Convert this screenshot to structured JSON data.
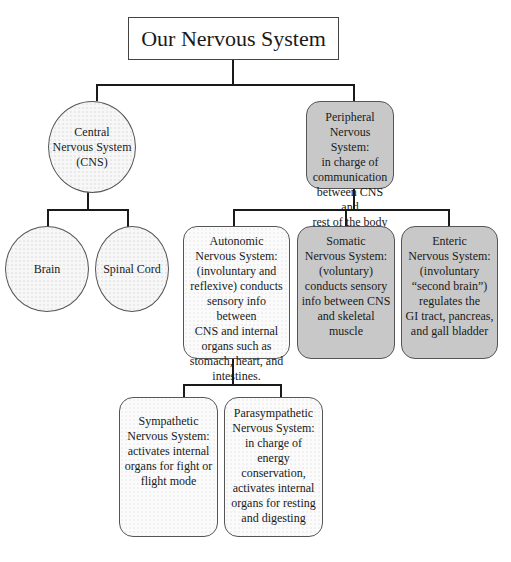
{
  "diagram": {
    "title": "Our Nervous System",
    "nodes": {
      "cns": {
        "label": "Central\nNervous System\n(CNS)",
        "shape": "circle"
      },
      "brain": {
        "label": "Brain",
        "shape": "circle"
      },
      "spinal_cord": {
        "label": "Spinal Cord",
        "shape": "circle"
      },
      "peripheral": {
        "label": "Peripheral\nNervous System:\nin charge of\ncommunication\nbetween CNS and\nrest of the body",
        "shape": "rounded-box",
        "fill": "#c8c8c8"
      },
      "autonomic": {
        "label": "Autonomic\nNervous System:\n(involuntary and\nreflexive) conducts\nsensory info between\nCNS and internal\norgans such as\nstomach, heart, and\nintestines.",
        "shape": "rounded-box",
        "fill": "#fbfbfb"
      },
      "somatic": {
        "label": "Somatic\nNervous System:\n(voluntary)\nconducts sensory\ninfo between CNS\nand skeletal\nmuscle",
        "shape": "rounded-box",
        "fill": "#c8c8c8"
      },
      "enteric": {
        "label": "Enteric\nNervous System:\n(involuntary\n“second brain”)\nregulates the\nGI tract, pancreas,\nand gall bladder",
        "shape": "rounded-box",
        "fill": "#c8c8c8"
      },
      "sympathetic": {
        "label": "Sympathetic\nNervous System:\nactivates internal\norgans for fight or\nflight mode",
        "shape": "rounded-box",
        "fill": "#fbfbfb"
      },
      "parasympathetic": {
        "label": "Parasympathetic\nNervous System:\nin charge of energy\nconservation,\nactivates internal\norgans for resting\nand digesting",
        "shape": "rounded-box",
        "fill": "#fbfbfb"
      }
    },
    "edges": [
      [
        "title",
        "cns"
      ],
      [
        "title",
        "peripheral"
      ],
      [
        "cns",
        "brain"
      ],
      [
        "cns",
        "spinal_cord"
      ],
      [
        "peripheral",
        "autonomic"
      ],
      [
        "peripheral",
        "somatic"
      ],
      [
        "peripheral",
        "enteric"
      ],
      [
        "autonomic",
        "sympathetic"
      ],
      [
        "autonomic",
        "parasympathetic"
      ]
    ]
  }
}
